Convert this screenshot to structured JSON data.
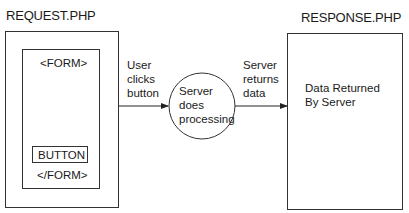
{
  "request": {
    "title": "REQUEST.PHP",
    "form_open": "<FORM>",
    "button_label": "BUTTON",
    "form_close": "</FORM>"
  },
  "arrow1": {
    "line1": "User",
    "line2": "clicks",
    "line3": "button"
  },
  "server": {
    "line1": "Server",
    "line2": "does",
    "line3": "processing"
  },
  "arrow2": {
    "line1": "Server",
    "line2": "returns",
    "line3": "data"
  },
  "response": {
    "title": "RESPONSE.PHP",
    "line1": "Data Returned",
    "line2": "By Server"
  }
}
